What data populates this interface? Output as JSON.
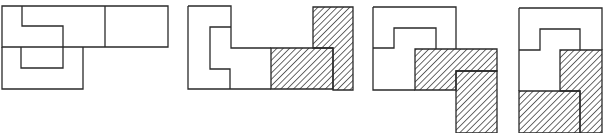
{
  "figure": {
    "colors": {
      "line": "#2a2a2a",
      "hatch": "#2a2a2a",
      "background": "#ffffff"
    },
    "panels": [
      {
        "id": "panel-1",
        "outlines": [
          "M2,6 L168,6 L168,47 L2,47 Z",
          "M105,6 L105,47",
          "M22,6 L22,26 L63,26 L63,68 L21,68 L21,47",
          "M2,47 L2,89 L83,89 L83,47"
        ],
        "hatched": []
      },
      {
        "id": "panel-2",
        "outlines": [
          "M188,6 L231,6 L231,48 L271,48",
          "M188,6 L188,89 L271,89",
          "M231,27 L210,27 L210,69 L230,69 L230,89"
        ],
        "hatched": [
          "M271,48 L333,48 L333,89 L271,89 Z",
          "M313,7 L353,7 L353,90 L333,90 L333,48 L313,48 Z"
        ]
      },
      {
        "id": "panel-3",
        "outlines": [
          "M373,7 L456,7 L456,49",
          "M373,7 L373,90 L415,90",
          "M373,48 L394,48 L394,28 L436,28 L436,49"
        ],
        "hatched": [
          "M415,49 L497,49 L497,71 L456,71 L456,90 L415,90 Z",
          "M456,71 L497,71 L497,133 L456,133 Z"
        ]
      },
      {
        "id": "panel-4",
        "outlines": [
          "M519,8 L602,8 L602,50",
          "M519,8 L519,91",
          "M519,50 L540,50 L540,29 L580,29 L580,50"
        ],
        "hatched": [
          "M560,50 L602,50 L602,133 L580,133 L580,91 L560,91 Z",
          "M519,91 L580,91 L580,133 L519,133 Z"
        ]
      }
    ]
  }
}
